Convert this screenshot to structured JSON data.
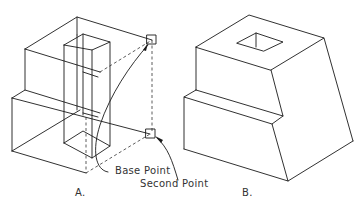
{
  "figure": {
    "labels": {
      "base_point": "Base Point",
      "second_point": "Second Point",
      "panel_a": "A.",
      "panel_b": "B."
    },
    "colors": {
      "line": "#1a1a1a",
      "background": "#ffffff",
      "text": "#333333"
    }
  }
}
